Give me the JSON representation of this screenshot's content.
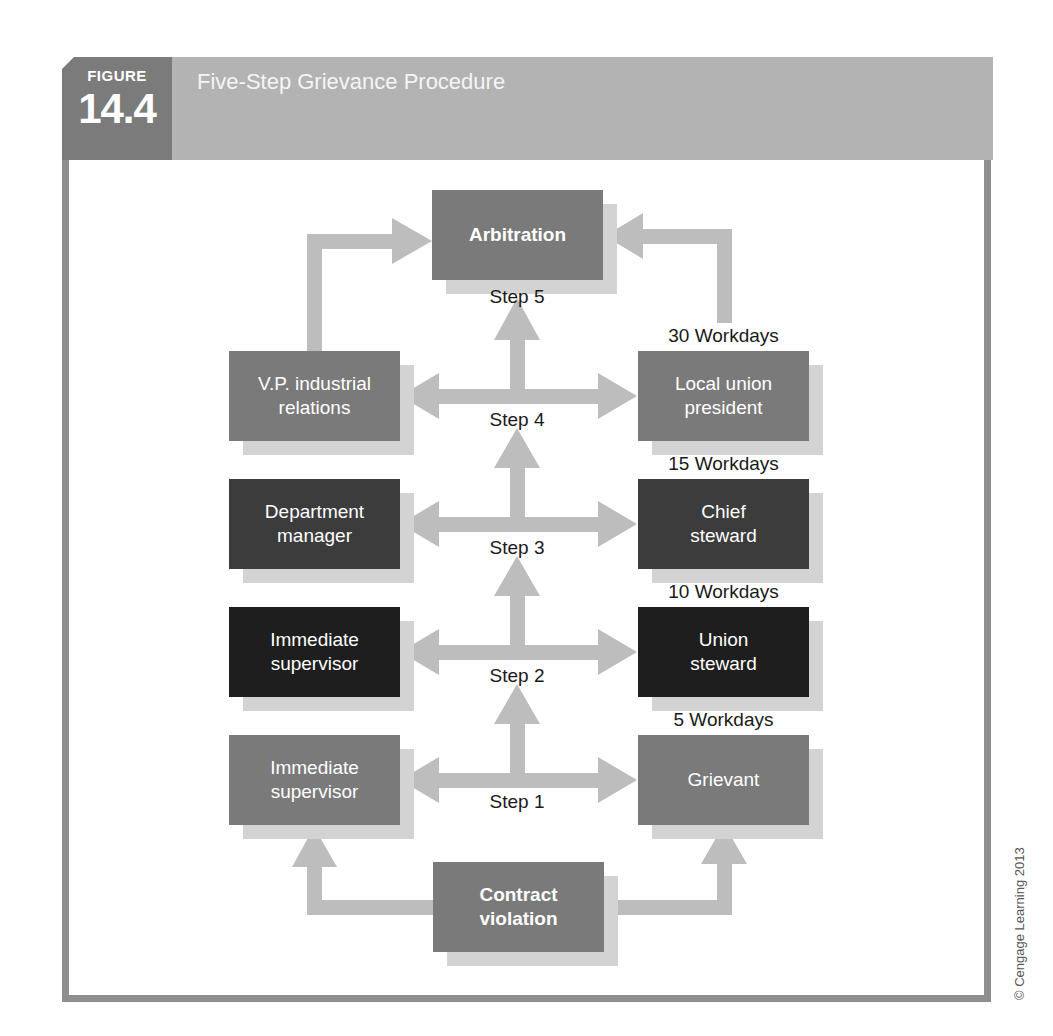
{
  "header": {
    "figure_label": "FIGURE",
    "figure_number": "14.4",
    "title": "Five-Step Grievance Procedure"
  },
  "colors": {
    "badge": "#7b7b7b",
    "title_bar": "#b3b3b3",
    "frame_border": "#8e8e8e",
    "arrow": "#bdbdbd",
    "box_shadow": "#d3d3d3",
    "box_mid": "#7a7a7a",
    "box_dark": "#3c3c3c",
    "box_black": "#1e1e1e"
  },
  "diagram": {
    "top": {
      "box": "Arbitration",
      "step": "Step 5"
    },
    "rows": [
      {
        "step": "Step 4",
        "management": [
          "V.P. industrial",
          "relations"
        ],
        "union": [
          "Local union",
          "president"
        ],
        "workdays": "30 Workdays"
      },
      {
        "step": "Step 3",
        "management": [
          "Department",
          "manager"
        ],
        "union": [
          "Chief",
          "steward"
        ],
        "workdays": "15 Workdays"
      },
      {
        "step": "Step 2",
        "management": [
          "Immediate",
          "supervisor"
        ],
        "union": [
          "Union",
          "steward"
        ],
        "workdays": "10 Workdays"
      },
      {
        "step": "Step 1",
        "management": [
          "Immediate",
          "supervisor"
        ],
        "union": [
          "Grievant"
        ],
        "workdays": "5 Workdays"
      }
    ],
    "bottom": {
      "box": [
        "Contract",
        "violation"
      ]
    }
  },
  "footer": {
    "copyright": "© Cengage Learning 2013"
  }
}
